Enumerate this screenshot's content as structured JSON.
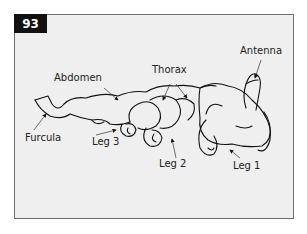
{
  "figure": {
    "number": "93",
    "colors": {
      "badge_bg": "#111111",
      "badge_text": "#ffffff",
      "panel_bg": "#efefef",
      "border": "#6e6e6e",
      "ink": "#222222"
    }
  },
  "labels": {
    "antenna": "Antenna",
    "thorax": "Thorax",
    "abdomen": "Abdomen",
    "furcula": "Furcula",
    "leg3": "Leg 3",
    "leg2": "Leg 2",
    "leg1": "Leg 1"
  }
}
